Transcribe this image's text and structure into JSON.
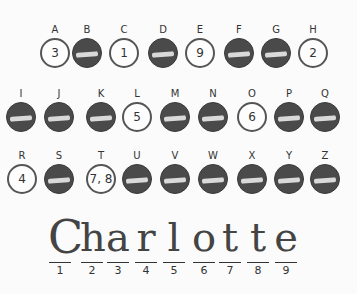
{
  "worksheet": {
    "rows": [
      [
        {
          "letter": "A",
          "style": "open",
          "number": "3"
        },
        {
          "letter": "B",
          "style": "dark",
          "number": ""
        },
        {
          "letter": "C",
          "style": "open",
          "number": "1"
        },
        {
          "letter": "D",
          "style": "dark",
          "number": ""
        },
        {
          "letter": "E",
          "style": "open",
          "number": "9"
        },
        {
          "letter": "F",
          "style": "dark",
          "number": ""
        },
        {
          "letter": "G",
          "style": "dark",
          "number": ""
        },
        {
          "letter": "H",
          "style": "open",
          "number": "2"
        }
      ],
      [
        {
          "letter": "I",
          "style": "dark",
          "number": ""
        },
        {
          "letter": "J",
          "style": "dark",
          "number": ""
        },
        {
          "letter": "K",
          "style": "dark",
          "number": ""
        },
        {
          "letter": "L",
          "style": "open",
          "number": "5"
        },
        {
          "letter": "M",
          "style": "dark",
          "number": ""
        },
        {
          "letter": "N",
          "style": "dark",
          "number": ""
        },
        {
          "letter": "O",
          "style": "open",
          "number": "6"
        },
        {
          "letter": "P",
          "style": "dark",
          "number": ""
        },
        {
          "letter": "Q",
          "style": "dark",
          "number": ""
        }
      ],
      [
        {
          "letter": "R",
          "style": "open",
          "number": "4"
        },
        {
          "letter": "S",
          "style": "dark",
          "number": ""
        },
        {
          "letter": "T",
          "style": "open",
          "number": "7, 8"
        },
        {
          "letter": "U",
          "style": "dark",
          "number": ""
        },
        {
          "letter": "V",
          "style": "dark",
          "number": ""
        },
        {
          "letter": "W",
          "style": "dark",
          "number": ""
        },
        {
          "letter": "X",
          "style": "dark",
          "number": ""
        },
        {
          "letter": "Y",
          "style": "dark",
          "number": ""
        },
        {
          "letter": "Z",
          "style": "dark",
          "number": ""
        }
      ]
    ],
    "answer_word": "Charlotte",
    "answer_letters": [
      "C",
      "h",
      "a",
      "r",
      "l",
      "o",
      "t",
      "t",
      "e"
    ],
    "positions": [
      "1",
      "2",
      "3",
      "4",
      "5",
      "6",
      "7",
      "8",
      "9"
    ]
  }
}
